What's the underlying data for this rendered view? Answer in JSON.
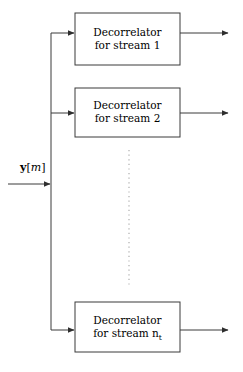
{
  "diagram": {
    "type": "block-diagram",
    "background_color": "#ffffff",
    "stroke_color": "#3a3a3a",
    "text_color": "#000000",
    "input": {
      "label_vector": "y",
      "label_open_bracket": "[",
      "label_index": "m",
      "label_close_bracket": "]",
      "label_full": "y[m]"
    },
    "blocks": [
      {
        "id": "decorrelator-1",
        "line1": "Decorrelator",
        "line2_prefix": "for stream ",
        "line2_stream": "1",
        "line2_subscript": "",
        "label_full": "Decorrelator for stream 1"
      },
      {
        "id": "decorrelator-2",
        "line1": "Decorrelator",
        "line2_prefix": "for stream ",
        "line2_stream": "2",
        "line2_subscript": "",
        "label_full": "Decorrelator for stream 2"
      },
      {
        "id": "decorrelator-nt",
        "line1": "Decorrelator",
        "line2_prefix": "for stream ",
        "line2_stream": "n",
        "line2_subscript": "t",
        "label_full": "Decorrelator for stream n_t"
      }
    ],
    "ellipsis": {
      "style": "vertical-dotted-line",
      "meaning": "additional streams omitted"
    }
  }
}
